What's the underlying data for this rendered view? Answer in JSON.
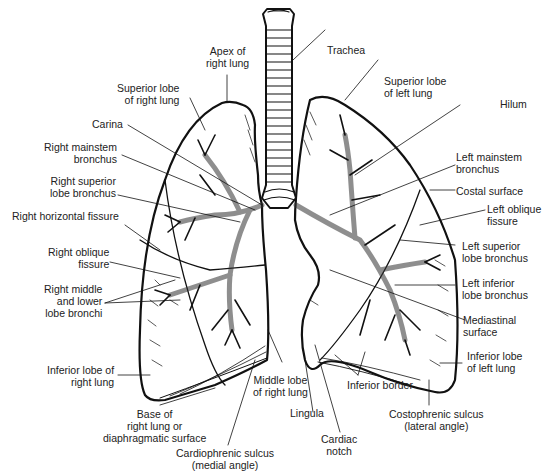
{
  "labels": {
    "apex_right": "Apex of\nright lung",
    "trachea": "Trachea",
    "superior_lobe_right": "Superior lobe\nof right lung",
    "superior_lobe_left": "Superior lobe\nof left lung",
    "hilum": "Hilum",
    "carina": "Carina",
    "right_mainstem": "Right mainstem\nbronchus",
    "left_mainstem": "Left mainstem\nbronchus",
    "right_superior_bronchus": "Right superior\nlobe bronchus",
    "costal_surface": "Costal surface",
    "right_horizontal_fissure": "Right horizontal fissure",
    "left_oblique_fissure": "Left oblique\nfissure",
    "right_oblique_fissure": "Right oblique\nfissure",
    "left_superior_bronchus": "Left superior\nlobe bronchus",
    "right_middle_lower_bronchi": "Right middle\nand lower\nlobe bronchi",
    "left_inferior_bronchus": "Left inferior\nlobe bronchus",
    "mediastinal_surface": "Mediastinal\nsurface",
    "inferior_lobe_right": "Inferior lobe of\nright lung",
    "inferior_lobe_left": "Inferior lobe\nof left lung",
    "middle_lobe_right": "Middle lobe\nof right lung",
    "inferior_border": "Inferior border",
    "base_right": "Base of\nright lung or\ndiaphragmatic surface",
    "lingula": "Lingula",
    "costophrenic": "Costophrenic sulcus\n(lateral angle)",
    "cardiac_notch": "Cardiac\nnotch",
    "cardiophrenic": "Cardiophrenic sulcus\n(medial angle)"
  }
}
